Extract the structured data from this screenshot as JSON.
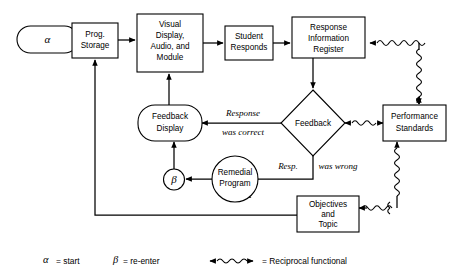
{
  "diagram": {
    "nodes": {
      "alpha": "α",
      "prog_storage": [
        "Prog.",
        "Storage"
      ],
      "visual_display": [
        "Visual",
        "Display,",
        "Audio, and",
        "Module"
      ],
      "student_responds": [
        "Student",
        "Responds"
      ],
      "response_register": [
        "Response",
        "Information",
        "Register"
      ],
      "performance_standards": [
        "Performance",
        "Standards"
      ],
      "feedback_diamond": "Feedback",
      "feedback_display": [
        "Feedback",
        "Display"
      ],
      "beta": "β",
      "remedial_program": [
        "Remedial",
        "Program"
      ],
      "objectives_topic": [
        "Objectives",
        "and",
        "Topic"
      ]
    },
    "edge_labels": {
      "response_was_correct": [
        "Response",
        "was correct"
      ],
      "resp_was_wrong_a": "Resp.",
      "resp_was_wrong_b": "was wrong"
    },
    "legend": {
      "alpha_symbol": "α",
      "alpha_equals": "= start",
      "beta_symbol": "β",
      "beta_equals": "= re-enter",
      "reciprocal_equals": "= Reciprocal functional"
    },
    "colors": {
      "stroke": "#000000",
      "fill": "#ffffff",
      "background": "#ffffff"
    }
  }
}
